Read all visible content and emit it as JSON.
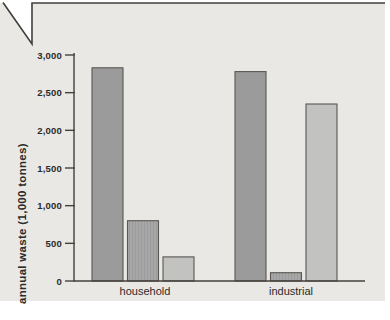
{
  "figure": {
    "panel_bg": "#e9e8e4",
    "frame_line_color": "#3f3f3d",
    "axis_line_color": "#45423e",
    "bar_border_color": "#5a5752",
    "text_color": "#2b2b2b"
  },
  "chart_data": {
    "type": "bar",
    "title": "",
    "categories": [
      "household",
      "industrial"
    ],
    "series": [
      {
        "name": "series-1",
        "color": "#9b9b9b",
        "values": [
          2830,
          2780
        ]
      },
      {
        "name": "series-2",
        "color": "#a7a7a7",
        "stripe_color": "#9c9c9c",
        "values": [
          800,
          110
        ]
      },
      {
        "name": "series-3",
        "color": "#c2c2c1",
        "values": [
          320,
          2350
        ]
      }
    ],
    "xlabel": "",
    "ylabel": "annual waste (1,000 tonnes)",
    "yticks": [
      0,
      500,
      1000,
      1500,
      2000,
      2500,
      3000
    ],
    "ytick_labels": [
      "0",
      "500",
      "1,000",
      "1,500",
      "2,000",
      "2,500",
      "3,000"
    ],
    "ylim": [
      0,
      3000
    ],
    "grid": false,
    "legend": "none"
  }
}
